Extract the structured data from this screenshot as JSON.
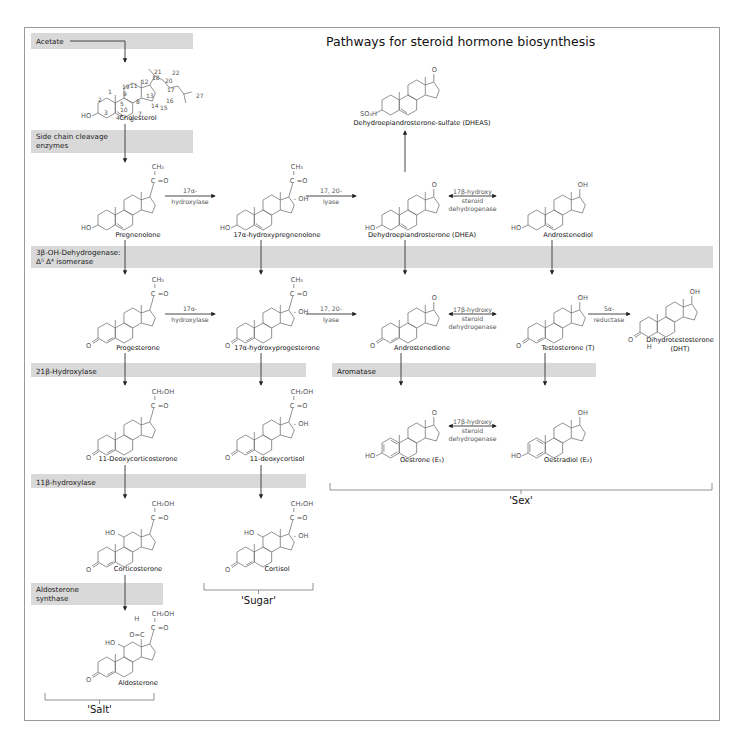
{
  "title": "Pathways for steroid hormone biosynthesis",
  "colors": {
    "band": "#d9d9d9",
    "line": "#777777",
    "text": "#111111"
  },
  "bands": [
    {
      "id": "acetate",
      "lines": [
        "Acetate"
      ],
      "x": 31,
      "y": 33,
      "w": 162,
      "h": 16
    },
    {
      "id": "side-chain-cleavage",
      "lines": [
        "Side chain cleavage",
        "enzymes"
      ],
      "x": 31,
      "y": 130,
      "w": 162,
      "h": 23
    },
    {
      "id": "3b-oh-dehydrogenase",
      "lines": [
        "3β-OH-Dehydrogenase:",
        "Δ⁵ Δ⁴ isomerase"
      ],
      "x": 31,
      "y": 246,
      "w": 682,
      "h": 22
    },
    {
      "id": "21b-hydroxylase",
      "lines": [
        "21β-Hydroxylase"
      ],
      "x": 31,
      "y": 363,
      "w": 275,
      "h": 14
    },
    {
      "id": "aromatase",
      "lines": [
        "Aromatase"
      ],
      "x": 332,
      "y": 363,
      "w": 264,
      "h": 14
    },
    {
      "id": "11b-hydroxylase",
      "lines": [
        "11β-hydroxylase"
      ],
      "x": 31,
      "y": 474,
      "w": 275,
      "h": 14
    },
    {
      "id": "aldosterone-synthase",
      "lines": [
        "Aldosterone",
        "synthase"
      ],
      "x": 31,
      "y": 583,
      "w": 132,
      "h": 22
    }
  ],
  "compounds": [
    {
      "id": "cholesterol",
      "name": "Cholesterol",
      "x": 98,
      "y": 68,
      "label_y": 120,
      "type": "cholesterol"
    },
    {
      "id": "pregnenolone",
      "name": "Pregnenolone",
      "x": 98,
      "y": 180,
      "label_y": 237,
      "type": "preg"
    },
    {
      "id": "17a-hydroxypregnenolone",
      "name": "17α-hydroxypregnenolone",
      "x": 237,
      "y": 180,
      "label_y": 237,
      "type": "preg-oh"
    },
    {
      "id": "dhea",
      "name": "Dehydroepiandrosterone (DHEA)",
      "x": 382,
      "y": 180,
      "label_y": 237,
      "type": "andro-5-one"
    },
    {
      "id": "androstenediol",
      "name": "Androstenediol",
      "x": 528,
      "y": 180,
      "label_y": 237,
      "type": "andro-5-ol"
    },
    {
      "id": "dheas",
      "name": "Dehydroepiandrosterone-sulfate (DHEAS)",
      "x": 382,
      "y": 65,
      "label_y": 125,
      "type": "dheas"
    },
    {
      "id": "progesterone",
      "name": "Progesterone",
      "x": 98,
      "y": 293,
      "label_y": 350,
      "type": "preg4"
    },
    {
      "id": "17a-hydroxyprogesterone",
      "name": "17α-hydroxyprogesterone",
      "x": 237,
      "y": 293,
      "label_y": 350,
      "type": "preg4-oh"
    },
    {
      "id": "androstenedione",
      "name": "Androstenedione",
      "x": 382,
      "y": 293,
      "label_y": 350,
      "type": "andro4-one"
    },
    {
      "id": "testosterone",
      "name": "Testosterone (T)",
      "x": 528,
      "y": 293,
      "label_y": 350,
      "type": "andro4-ol"
    },
    {
      "id": "dht",
      "name": "Dihydrotestosterone",
      "name2": "(DHT)",
      "x": 640,
      "y": 287,
      "label_y": 342,
      "type": "dht"
    },
    {
      "id": "deoxycorticosterone",
      "name": "11-Deoxycorticosterone",
      "x": 98,
      "y": 405,
      "label_y": 461,
      "type": "preg4-ch2oh"
    },
    {
      "id": "deoxycortisol",
      "name": "11-deoxycortisol",
      "x": 237,
      "y": 405,
      "label_y": 461,
      "type": "preg4-ch2oh-oh"
    },
    {
      "id": "oestrone",
      "name": "Oestrone (E₁)",
      "x": 382,
      "y": 408,
      "label_y": 462,
      "type": "estro-one"
    },
    {
      "id": "oestradiol",
      "name": "Oestradiol (E₂)",
      "x": 528,
      "y": 408,
      "label_y": 462,
      "type": "estro-ol"
    },
    {
      "id": "corticosterone",
      "name": "Corticosterone",
      "x": 98,
      "y": 517,
      "label_y": 571,
      "type": "cortico"
    },
    {
      "id": "cortisol",
      "name": "Cortisol",
      "x": 237,
      "y": 517,
      "label_y": 571,
      "type": "cortisol"
    },
    {
      "id": "aldosterone",
      "name": "Aldosterone",
      "x": 98,
      "y": 627,
      "label_y": 685,
      "type": "aldo"
    }
  ],
  "enzymes": [
    {
      "id": "17a-hydroxylase-1",
      "lines": [
        "17α-",
        "hydroxylase"
      ],
      "x1": 165,
      "x2": 215,
      "y": 196,
      "bidir": false
    },
    {
      "id": "17-20-lyase-1",
      "lines": [
        "17, 20-",
        "lyase"
      ],
      "x1": 306,
      "x2": 356,
      "y": 196,
      "bidir": false
    },
    {
      "id": "17b-hsd-1",
      "lines": [
        "17β-hydroxy",
        "steroid",
        "dehydrogenase"
      ],
      "x1": 449,
      "x2": 496,
      "y": 196,
      "bidir": true
    },
    {
      "id": "17a-hydroxylase-2",
      "lines": [
        "17α-",
        "hydroxylase"
      ],
      "x1": 165,
      "x2": 215,
      "y": 314,
      "bidir": false
    },
    {
      "id": "17-20-lyase-2",
      "lines": [
        "17, 20-",
        "lyase"
      ],
      "x1": 306,
      "x2": 356,
      "y": 314,
      "bidir": false
    },
    {
      "id": "17b-hsd-2",
      "lines": [
        "17β-hydroxy",
        "steroid",
        "dehydrogenase"
      ],
      "x1": 449,
      "x2": 496,
      "y": 314,
      "bidir": true
    },
    {
      "id": "5a-reductase",
      "lines": [
        "5α-",
        "reductase"
      ],
      "x1": 588,
      "x2": 630,
      "y": 314,
      "bidir": false
    },
    {
      "id": "17b-hsd-3",
      "lines": [
        "17β-hydroxy",
        "steroid",
        "dehydrogenase"
      ],
      "x1": 449,
      "x2": 496,
      "y": 426,
      "bidir": true
    }
  ],
  "vertical_arrows": [
    {
      "id": "acetate-to-cholesterol",
      "x": 125,
      "y1": 41,
      "y2": 62,
      "from_x": 70
    },
    {
      "id": "cholesterol-to-pregnenolone",
      "x": 125,
      "y1": 124,
      "y2": 162
    },
    {
      "id": "pregnenolone-to-progesterone",
      "x": 125,
      "y1": 240,
      "y2": 274
    },
    {
      "id": "17oh-preg-to-17oh-prog",
      "x": 261,
      "y1": 240,
      "y2": 274
    },
    {
      "id": "dhea-to-androstenedione",
      "x": 405,
      "y1": 240,
      "y2": 274
    },
    {
      "id": "androstenediol-to-testosterone",
      "x": 552,
      "y1": 240,
      "y2": 274
    },
    {
      "id": "dhea-to-dheas",
      "x": 405,
      "y1": 172,
      "y2": 131,
      "up": true
    },
    {
      "id": "progesterone-to-doc",
      "x": 125,
      "y1": 353,
      "y2": 385
    },
    {
      "id": "17oh-prog-to-11-deoxycortisol",
      "x": 261,
      "y1": 353,
      "y2": 385
    },
    {
      "id": "androstenedione-to-oestrone",
      "x": 401,
      "y1": 353,
      "y2": 385
    },
    {
      "id": "testosterone-to-oestradiol",
      "x": 545,
      "y1": 353,
      "y2": 385
    },
    {
      "id": "doc-to-corticosterone",
      "x": 125,
      "y1": 465,
      "y2": 498
    },
    {
      "id": "11-deoxycortisol-to-cortisol",
      "x": 261,
      "y1": 465,
      "y2": 498
    },
    {
      "id": "corticosterone-to-aldosterone",
      "x": 125,
      "y1": 575,
      "y2": 610
    }
  ],
  "brackets": [
    {
      "id": "salt",
      "label": "'Salt'",
      "x1": 45,
      "x2": 154,
      "y": 700,
      "label_y": 713
    },
    {
      "id": "sugar",
      "label": "'Sugar'",
      "x1": 204,
      "x2": 313,
      "y": 590,
      "label_y": 604
    },
    {
      "id": "sex",
      "label": "'Sex'",
      "x1": 330,
      "x2": 712,
      "y": 490,
      "label_y": 504
    }
  ],
  "cholesterol_numbers": [
    "1",
    "2",
    "3",
    "4",
    "5",
    "6",
    "7",
    "8",
    "9",
    "10",
    "11",
    "12",
    "13",
    "14",
    "15",
    "16",
    "17",
    "18",
    "19",
    "20",
    "21",
    "22",
    "27"
  ]
}
